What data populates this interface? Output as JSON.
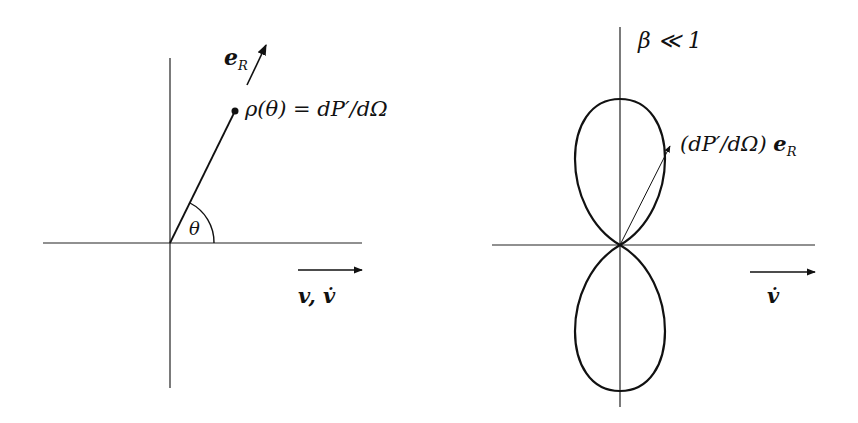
{
  "left_diagram": {
    "e_R_label": "e",
    "e_R_sub": "R",
    "rho_label": "ρ(θ) = dP′/dΩ",
    "theta_label": "θ",
    "velocity_label": "v, v̇"
  },
  "right_diagram": {
    "beta_label": "β ≪ 1",
    "vector_label_prefix": "(dP′/dΩ) ",
    "vector_label_e": "e",
    "vector_label_sub": "R",
    "accel_label": "v̇"
  },
  "colors": {
    "ink": "#111111",
    "background": "#ffffff"
  }
}
